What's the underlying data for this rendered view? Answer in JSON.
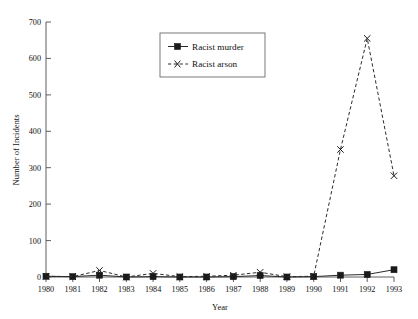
{
  "chart_data": {
    "type": "line",
    "title": "",
    "subtitle": "",
    "xlabel": "Year",
    "ylabel": "Number of Incidents",
    "categories": [
      "1980",
      "1981",
      "1982",
      "1983",
      "1984",
      "1985",
      "1986",
      "1987",
      "1988",
      "1989",
      "1990",
      "1991",
      "1992",
      "1993"
    ],
    "x": [
      1980,
      1981,
      1982,
      1983,
      1984,
      1985,
      1986,
      1987,
      1988,
      1989,
      1990,
      1991,
      1992,
      1993
    ],
    "series": [
      {
        "name": "Racist murder",
        "marker": "filled-square",
        "linestyle": "solid",
        "color": "#1a1a1a",
        "values": [
          2,
          1,
          5,
          0,
          1,
          0,
          0,
          1,
          4,
          0,
          1,
          5,
          7,
          20
        ]
      },
      {
        "name": "Racist arson",
        "marker": "x",
        "linestyle": "dashed",
        "color": "#1a1a1a",
        "values": [
          2,
          1,
          18,
          0,
          10,
          1,
          2,
          5,
          13,
          1,
          2,
          350,
          655,
          278
        ]
      }
    ],
    "ylim": [
      0,
      700
    ],
    "yticks": [
      0,
      100,
      200,
      300,
      400,
      500,
      600,
      700
    ],
    "ytick_labels": [
      "0",
      "100",
      "200",
      "300",
      "400",
      "500",
      "600",
      "700"
    ],
    "grid": false,
    "legend_position": "upper-center",
    "legend_entries": [
      "Racist murder",
      "Racist arson"
    ]
  },
  "axes": {
    "y_title": "Number of Incidents",
    "x_title": "Year"
  },
  "legend": {
    "entry_murder": "Racist murder",
    "entry_arson": "Racist arson"
  }
}
